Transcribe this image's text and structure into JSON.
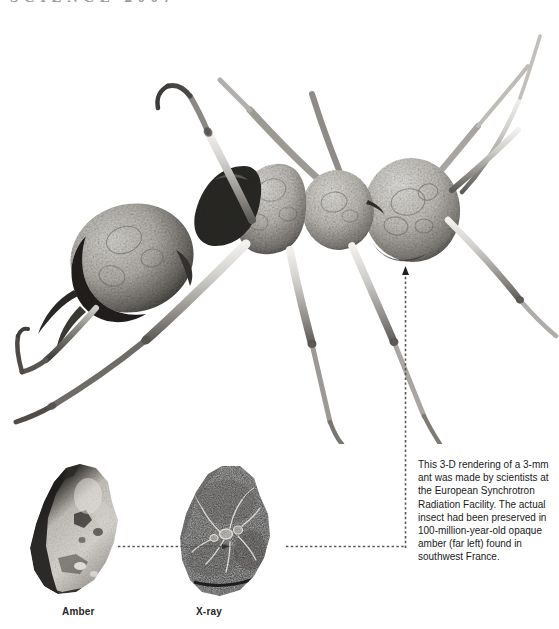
{
  "masthead": {
    "text": "SCIENCE 2007",
    "swatch_color": "#b4b4b4"
  },
  "figure": {
    "alt_label": "ant-3d-rendering"
  },
  "specimens": [
    {
      "id": "amber",
      "label": "Amber"
    },
    {
      "id": "xray",
      "label": "X-ray"
    }
  ],
  "caption": {
    "text": "This 3-D rendering of a 3-mm ant was made by scientists at the European Synchrotron Radiation Facility. The actual insect had been preserved in 100-million-year-old opaque amber (far left) found in southwest France."
  },
  "connectors": [
    {
      "id": "amber-to-xray",
      "direction": "right",
      "arrowhead": true
    },
    {
      "id": "xray-to-vertical",
      "direction": "right",
      "arrowhead": false
    },
    {
      "id": "vertical-to-ant",
      "direction": "up",
      "arrowhead": true
    }
  ],
  "colors": {
    "background": "#ffffff",
    "text": "#1a1a1a",
    "label": "#262626",
    "connector": "#555555",
    "masthead": "#9a9a9a"
  }
}
